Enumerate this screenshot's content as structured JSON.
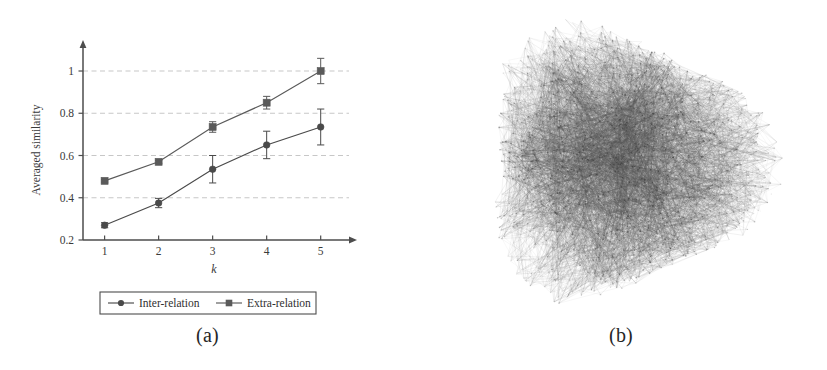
{
  "figure": {
    "panels": [
      {
        "id": "a",
        "caption": "(a)",
        "kind": "chart"
      },
      {
        "id": "b",
        "caption": "(b)",
        "kind": "network-graph"
      }
    ]
  },
  "chart_data": {
    "type": "line",
    "title": "",
    "xlabel": "k",
    "ylabel": "Averaged similarity",
    "x": [
      1,
      2,
      3,
      4,
      5
    ],
    "xticklabels": [
      "1",
      "2",
      "3",
      "4",
      "5"
    ],
    "yticks": [
      0.2,
      0.4,
      0.6,
      0.8,
      1
    ],
    "yticklabels": [
      "0.2",
      "0.4",
      "0.6",
      "0.8",
      "1"
    ],
    "xlim": [
      0.6,
      5.45
    ],
    "ylim": [
      0.2,
      1.09
    ],
    "grid": "horizontal-dashed",
    "legend_position": "below-axes",
    "error_bars": true,
    "series": [
      {
        "name": "Inter-relation",
        "marker": "circle",
        "color": "#4a4a4a",
        "values": [
          0.27,
          0.375,
          0.535,
          0.65,
          0.735
        ],
        "errors": [
          0.012,
          0.022,
          0.065,
          0.065,
          0.085
        ]
      },
      {
        "name": "Extra-relation",
        "marker": "square",
        "color": "#5a5a5a",
        "values": [
          0.48,
          0.57,
          0.735,
          0.85,
          1.0
        ],
        "errors": [
          0.006,
          0.007,
          0.025,
          0.03,
          0.06
        ]
      }
    ]
  },
  "network": {
    "label": "dense hairball network",
    "node_count": 1400,
    "edge_count": 5200,
    "center_x": 620,
    "center_y": 162,
    "radius": 148,
    "edge_color": "#555555",
    "node_color": "#3a3a3a"
  },
  "colors": {
    "axis": "#4d4d4d",
    "grid": "#bdbdbd",
    "text": "#333333",
    "ink": "#3c3c3c"
  }
}
